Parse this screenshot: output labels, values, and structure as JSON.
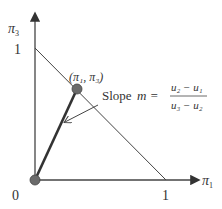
{
  "diagram": {
    "y_axis_label": "π",
    "y_axis_sub": "3",
    "x_axis_label": "π",
    "x_axis_sub": "1",
    "y_tick_one": "1",
    "x_tick_one": "1",
    "origin_label": "0",
    "point_label": "(π₁, π₃)",
    "slope_word": "Slope",
    "slope_var": "m =",
    "numerator": "u₂ − u₁",
    "denominator": "u₃ − u₂",
    "colors": {
      "line": "#444444",
      "point": "#6b6b6b",
      "text": "#333333"
    }
  }
}
